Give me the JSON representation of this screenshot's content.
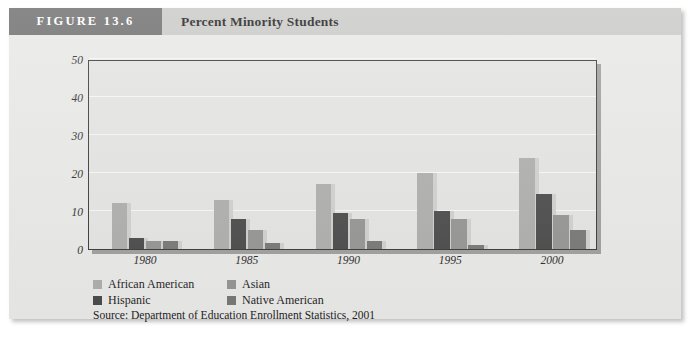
{
  "figure": {
    "number_label": "FIGURE 13.6",
    "title": "Percent Minority Students",
    "source": "Source: Department of Education Enrollment Statistics, 2001"
  },
  "colors": {
    "banner": "#6e6e6e",
    "title_strip": "#c9c9c7",
    "card": "#e8e8e6",
    "plot_background": "#e3e3e1",
    "plot_border": "#3a3a3a",
    "gridline": "#f6f6f4",
    "african_american": "#adadab",
    "asian": "#949492",
    "hispanic": "#4a4a4a",
    "native_american": "#777775",
    "bar_side": "#cfcfcd"
  },
  "chart_data": {
    "type": "bar",
    "title": "Percent Minority Students",
    "xlabel": "",
    "ylabel": "",
    "categories": [
      "1980",
      "1985",
      "1990",
      "1995",
      "2000"
    ],
    "ylim": [
      0,
      50
    ],
    "yticks": [
      0,
      10,
      20,
      30,
      40,
      50
    ],
    "grid": true,
    "legend_position": "bottom-left",
    "series": [
      {
        "name": "African American",
        "color": "#adadab",
        "values": [
          12,
          13,
          17,
          20,
          24
        ]
      },
      {
        "name": "Hispanic",
        "color": "#4a4a4a",
        "values": [
          3,
          8,
          9.5,
          10,
          14.5
        ]
      },
      {
        "name": "Asian",
        "color": "#949492",
        "values": [
          2,
          5,
          8,
          8,
          9
        ]
      },
      {
        "name": "Native American",
        "color": "#777775",
        "values": [
          2,
          1.5,
          2,
          1,
          5
        ]
      }
    ],
    "legend_order": [
      "African American",
      "Asian",
      "Hispanic",
      "Native American"
    ]
  }
}
